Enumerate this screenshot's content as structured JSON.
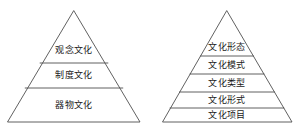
{
  "figure": {
    "background_color": "#ffffff",
    "stroke_color": "#4f4f4f",
    "text_color": "#1a1a1a",
    "diagrams": [
      {
        "name": "culture-structure-pyramid",
        "tier_count": 3,
        "apex": {
          "x": 74,
          "y": 11
        },
        "base": {
          "left_x": 8,
          "right_x": 140,
          "y": 122
        },
        "divider_y": [
          63,
          88
        ],
        "tiers": [
          {
            "index": 1,
            "label": "观念文化",
            "center_x": 74,
            "center_y": 50
          },
          {
            "index": 2,
            "label": "制度文化",
            "center_x": 74,
            "center_y": 75
          },
          {
            "index": 3,
            "label": "器物文化",
            "center_x": 74,
            "center_y": 105
          }
        ]
      },
      {
        "name": "culture-hierarchy-pyramid",
        "tier_count": 5,
        "apex": {
          "x": 227,
          "y": 11
        },
        "base": {
          "left_x": 163,
          "right_x": 292,
          "y": 122
        },
        "divider_y": [
          56,
          74,
          92,
          108
        ],
        "tiers": [
          {
            "index": 1,
            "label": "文化形态",
            "center_x": 227,
            "center_y": 47
          },
          {
            "index": 2,
            "label": "文化模式",
            "center_x": 227,
            "center_y": 65
          },
          {
            "index": 3,
            "label": "文化类型",
            "center_x": 227,
            "center_y": 83
          },
          {
            "index": 4,
            "label": "文化形式",
            "center_x": 227,
            "center_y": 100
          },
          {
            "index": 5,
            "label": "文化项目",
            "center_x": 227,
            "center_y": 115
          }
        ]
      }
    ]
  }
}
